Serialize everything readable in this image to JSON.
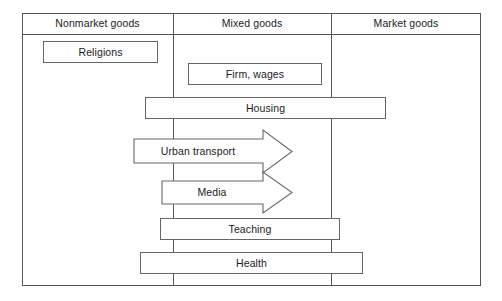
{
  "diagram": {
    "columns": [
      {
        "id": "nonmarket",
        "label": "Nonmarket goods"
      },
      {
        "id": "mixed",
        "label": "Mixed goods"
      },
      {
        "id": "market",
        "label": "Market goods"
      }
    ],
    "rows": [
      {
        "id": "religions",
        "label": "Religions",
        "shape": "rectangle",
        "span": "Nonmarket goods"
      },
      {
        "id": "firm-wages",
        "label": "Firm, wages",
        "shape": "rectangle",
        "span": "Mixed goods"
      },
      {
        "id": "housing",
        "label": "Housing",
        "shape": "rectangle",
        "span": "Nonmarket goods to Market goods"
      },
      {
        "id": "urban-transport",
        "label": "Urban transport",
        "shape": "arrow-right",
        "span": "Nonmarket goods to Mixed goods"
      },
      {
        "id": "media",
        "label": "Media",
        "shape": "arrow-right",
        "span": "Mixed goods"
      },
      {
        "id": "teaching",
        "label": "Teaching",
        "shape": "rectangle",
        "span": "Nonmarket goods to Market goods"
      },
      {
        "id": "health",
        "label": "Health",
        "shape": "rectangle",
        "span": "Nonmarket goods to Market goods"
      }
    ],
    "colors": {
      "frame_stroke": "#555555",
      "box_stroke": "#666666",
      "background": "#ffffff",
      "text": "#1a1a1a"
    }
  }
}
